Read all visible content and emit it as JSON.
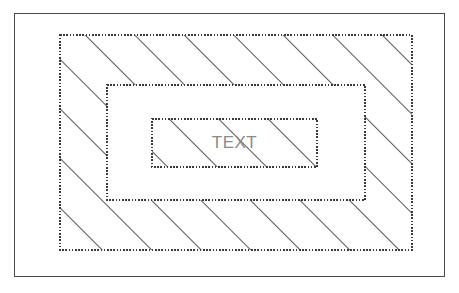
{
  "figure": {
    "background_color": "#ffffff"
  },
  "outer_frame": {
    "name": "outer-frame",
    "style": "solid",
    "stroke_color": "#4a4a4a",
    "stroke_width": 1,
    "x": 14,
    "y": 13,
    "width": 431,
    "height": 264
  },
  "regions": [
    {
      "name": "outer-hatched-region",
      "label": "",
      "hatched": true,
      "border_style": "dotted",
      "stroke_color": "#3a3a3a",
      "fill": "#ffffff",
      "x": 60,
      "y": 35,
      "width": 352,
      "height": 215
    },
    {
      "name": "middle-clear-region",
      "label": "",
      "hatched": false,
      "border_style": "dotted",
      "stroke_color": "#3a3a3a",
      "fill": "#ffffff",
      "x": 107,
      "y": 85,
      "width": 258,
      "height": 115
    },
    {
      "name": "inner-hatched-region",
      "label": "TEXT",
      "hatched": true,
      "border_style": "dotted",
      "stroke_color": "#3a3a3a",
      "fill": "#ffffff",
      "x": 152,
      "y": 119,
      "width": 165,
      "height": 48
    }
  ],
  "hatching": {
    "angle_degrees": 45,
    "direction": "lower-left-to-upper-right",
    "spacing_px": 35,
    "stroke_color": "#2b2b2b",
    "stroke_width": 1.6
  },
  "text_label": {
    "value": "TEXT",
    "color": "#8a8a8a",
    "font_size_px": 17
  }
}
